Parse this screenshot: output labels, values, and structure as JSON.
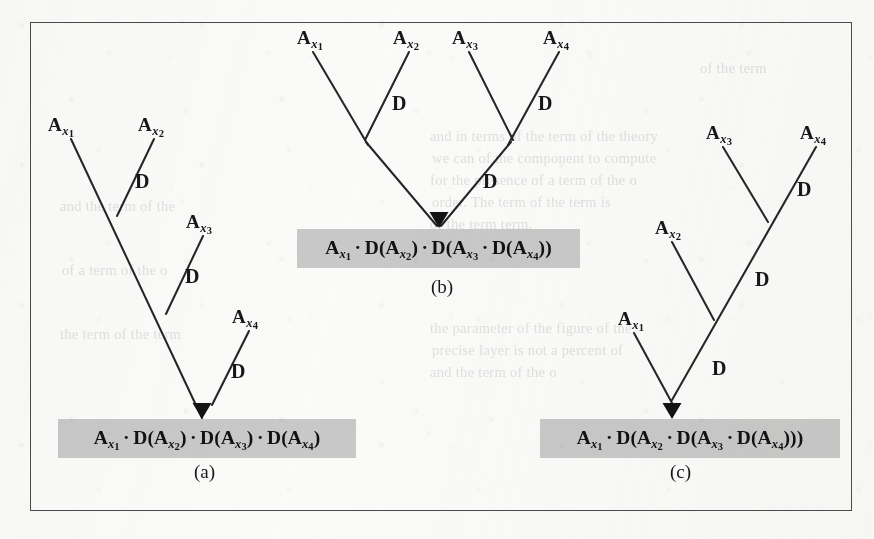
{
  "figure": {
    "border_color": "#4c4c4f",
    "ink_color": "#262629",
    "highlight_color": "#c9c9c9",
    "page_background": "#fbfbfa"
  },
  "bleed_through_text": [
    {
      "text": "and in terms of the term of the theory",
      "x": 430,
      "y": 128
    },
    {
      "text": "we can of the component to compute",
      "x": 432,
      "y": 150
    },
    {
      "text": "for the presence of a term of the o",
      "x": 430,
      "y": 172
    },
    {
      "text": "order. The term of the term is",
      "x": 432,
      "y": 194
    },
    {
      "text": "of the term term.",
      "x": 430,
      "y": 216
    },
    {
      "text": "the parameter of the figure of the",
      "x": 430,
      "y": 320
    },
    {
      "text": "precise layer is not a percent of",
      "x": 432,
      "y": 342
    },
    {
      "text": "and the term of the o",
      "x": 430,
      "y": 364
    },
    {
      "text": "and the term of the",
      "x": 60,
      "y": 198
    },
    {
      "text": "of a term of the o",
      "x": 62,
      "y": 262
    },
    {
      "text": "the term of the term",
      "x": 60,
      "y": 326
    },
    {
      "text": "of the term",
      "x": 700,
      "y": 60
    }
  ],
  "panels": [
    {
      "id": "panel-a",
      "caption": "(a)",
      "caption_x": 194,
      "caption_y": 461,
      "shape": "left-leaning-cascade",
      "leaf_labels": [
        {
          "base": "A",
          "sub": "x",
          "num": "1",
          "x": 48,
          "y": 114
        },
        {
          "base": "A",
          "sub": "x",
          "num": "2",
          "x": 138,
          "y": 114
        },
        {
          "base": "A",
          "sub": "x",
          "num": "3",
          "x": 186,
          "y": 211
        },
        {
          "base": "A",
          "sub": "x",
          "num": "4",
          "x": 232,
          "y": 306
        }
      ],
      "operator_labels": [
        {
          "text": "D",
          "x": 135,
          "y": 170
        },
        {
          "text": "D",
          "x": 185,
          "y": 265
        },
        {
          "text": "D",
          "x": 231,
          "y": 360
        }
      ],
      "formula": {
        "box_x": 58,
        "box_y": 419,
        "box_width": 298,
        "terms": [
          {
            "kind": "atom",
            "base": "A",
            "sub": "x",
            "num": "1"
          },
          {
            "kind": "dot"
          },
          {
            "kind": "func",
            "text": "D(",
            "base": "A",
            "sub": "x",
            "num": "2",
            "close": ")"
          },
          {
            "kind": "dot"
          },
          {
            "kind": "func",
            "text": "D(",
            "base": "A",
            "sub": "x",
            "num": "3",
            "close": ")"
          },
          {
            "kind": "dot"
          },
          {
            "kind": "func",
            "text": "D(",
            "base": "A",
            "sub": "x",
            "num": "4",
            "close": ")"
          }
        ],
        "plain": "A_x1 · D(A_x2) · D(A_x3) · D(A_x4)"
      }
    },
    {
      "id": "panel-b",
      "caption": "(b)",
      "caption_x": 431,
      "caption_y": 276,
      "shape": "balanced-binary-tree",
      "leaf_labels": [
        {
          "base": "A",
          "sub": "x",
          "num": "1",
          "x": 297,
          "y": 27
        },
        {
          "base": "A",
          "sub": "x",
          "num": "2",
          "x": 393,
          "y": 27
        },
        {
          "base": "A",
          "sub": "x",
          "num": "3",
          "x": 452,
          "y": 27
        },
        {
          "base": "A",
          "sub": "x",
          "num": "4",
          "x": 543,
          "y": 27
        }
      ],
      "operator_labels": [
        {
          "text": "D",
          "x": 392,
          "y": 92
        },
        {
          "text": "D",
          "x": 538,
          "y": 92
        },
        {
          "text": "D",
          "x": 483,
          "y": 170
        }
      ],
      "formula": {
        "box_x": 297,
        "box_y": 229,
        "box_width": 283,
        "terms": [
          {
            "kind": "atom",
            "base": "A",
            "sub": "x",
            "num": "1"
          },
          {
            "kind": "dot"
          },
          {
            "kind": "func",
            "text": "D(",
            "base": "A",
            "sub": "x",
            "num": "2",
            "close": ")"
          },
          {
            "kind": "dot"
          },
          {
            "kind": "func",
            "text": "D(",
            "base": "A",
            "sub": "x",
            "num": "3",
            "close": ""
          },
          {
            "kind": "dot"
          },
          {
            "kind": "func",
            "text": "D(",
            "base": "A",
            "sub": "x",
            "num": "4",
            "close": "))"
          }
        ],
        "plain": "A_x1 · D(A_x2) · D(A_x3 · D(A_x4))"
      }
    },
    {
      "id": "panel-c",
      "caption": "(c)",
      "caption_x": 670,
      "caption_y": 461,
      "shape": "right-leaning-cascade",
      "leaf_labels": [
        {
          "base": "A",
          "sub": "x",
          "num": "3",
          "x": 706,
          "y": 122
        },
        {
          "base": "A",
          "sub": "x",
          "num": "4",
          "x": 800,
          "y": 122
        },
        {
          "base": "A",
          "sub": "x",
          "num": "2",
          "x": 655,
          "y": 217
        },
        {
          "base": "A",
          "sub": "x",
          "num": "1",
          "x": 618,
          "y": 308
        }
      ],
      "operator_labels": [
        {
          "text": "D",
          "x": 797,
          "y": 178
        },
        {
          "text": "D",
          "x": 755,
          "y": 268
        },
        {
          "text": "D",
          "x": 712,
          "y": 357
        }
      ],
      "formula": {
        "box_x": 540,
        "box_y": 419,
        "box_width": 300,
        "terms": [
          {
            "kind": "atom",
            "base": "A",
            "sub": "x",
            "num": "1"
          },
          {
            "kind": "dot"
          },
          {
            "kind": "func",
            "text": "D(",
            "base": "A",
            "sub": "x",
            "num": "2",
            "close": ""
          },
          {
            "kind": "dot"
          },
          {
            "kind": "func",
            "text": "D(",
            "base": "A",
            "sub": "x",
            "num": "3",
            "close": ""
          },
          {
            "kind": "dot"
          },
          {
            "kind": "func",
            "text": "D(",
            "base": "A",
            "sub": "x",
            "num": "4",
            "close": ")))"
          }
        ],
        "plain": "A_x1 · D(A_x2 · D(A_x3 · D(A_x4)))"
      }
    }
  ],
  "edges": {
    "panel-a": [
      {
        "x1": 71,
        "y1": 139,
        "x2": 202,
        "y2": 418
      },
      {
        "x1": 154,
        "y1": 139,
        "x2": 117,
        "y2": 216
      },
      {
        "x1": 203,
        "y1": 236,
        "x2": 166,
        "y2": 314
      },
      {
        "x1": 249,
        "y1": 331,
        "x2": 212,
        "y2": 405
      }
    ],
    "panel-b": [
      {
        "x1": 313,
        "y1": 52,
        "x2": 368,
        "y2": 145
      },
      {
        "x1": 409,
        "y1": 52,
        "x2": 365,
        "y2": 140
      },
      {
        "x1": 469,
        "y1": 52,
        "x2": 513,
        "y2": 140
      },
      {
        "x1": 559,
        "y1": 52,
        "x2": 508,
        "y2": 145
      },
      {
        "x1": 366,
        "y1": 142,
        "x2": 437,
        "y2": 226
      },
      {
        "x1": 511,
        "y1": 142,
        "x2": 441,
        "y2": 226
      }
    ],
    "panel-c": [
      {
        "x1": 723,
        "y1": 147,
        "x2": 768,
        "y2": 222
      },
      {
        "x1": 816,
        "y1": 147,
        "x2": 672,
        "y2": 400
      },
      {
        "x1": 672,
        "y1": 242,
        "x2": 714,
        "y2": 320
      },
      {
        "x1": 634,
        "y1": 333,
        "x2": 672,
        "y2": 403
      }
    ]
  },
  "arrowheads": [
    {
      "panel": "panel-a",
      "x": 202,
      "y": 419
    },
    {
      "panel": "panel-b",
      "x": 439,
      "y": 228
    },
    {
      "panel": "panel-c",
      "x": 672,
      "y": 419
    }
  ]
}
